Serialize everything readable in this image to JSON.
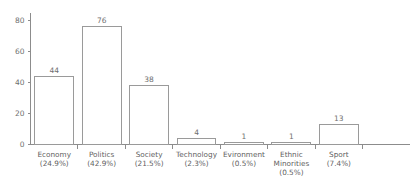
{
  "chart_data": {
    "type": "bar",
    "title": "",
    "subtitle": "",
    "xlabel": "",
    "ylabel": "",
    "ylim": [
      0,
      85
    ],
    "yticks": [
      0,
      20,
      40,
      60,
      80
    ],
    "ytick_labels": [
      "0",
      "20",
      "40",
      "60",
      "80"
    ],
    "grid": false,
    "legend": false,
    "legend_position": "none",
    "categories": [
      "Economy",
      "Politics",
      "Society",
      "Technology",
      "Evironment",
      "Ethnic Minorities",
      "Sport"
    ],
    "category_lines": [
      [
        "Economy",
        "(24.9%)"
      ],
      [
        "Politics",
        "(42.9%)"
      ],
      [
        "Society",
        "(21.5%)"
      ],
      [
        "Technology",
        "(2.3%)"
      ],
      [
        "Evironment",
        "(0.5%)"
      ],
      [
        "Ethnic",
        "Minorities",
        "(0.5%)"
      ],
      [
        "Sport",
        "(7.4%)"
      ]
    ],
    "percent_labels": [
      "24.9%",
      "42.9%",
      "21.5%",
      "2.3%",
      "0.5%",
      "0.5%",
      "7.4%"
    ],
    "values": [
      44,
      76,
      38,
      4,
      1,
      1,
      13
    ],
    "value_labels": [
      "44",
      "76",
      "38",
      "4",
      "1",
      "1",
      "13"
    ],
    "colors": {
      "bar_fill": "#ffffff",
      "bar_stroke": "#9a9a9a",
      "axis": "#8c8c8c",
      "text": "#6f6f6f",
      "background": "#ffffff"
    }
  }
}
